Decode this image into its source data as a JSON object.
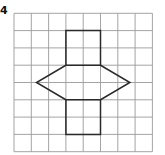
{
  "question": {
    "number": "4"
  },
  "grid": {
    "cols": 8,
    "rows": 8,
    "origin_x": 14,
    "origin_y": 13.3,
    "cell": 17.3,
    "line_color": "#9a9a9a"
  },
  "shape": {
    "stroke_color": "#2a2a2a",
    "description": "Net of a triangular/hexagonal prism: vertical rectangle 2 cols wide x 6 rows tall with two triangular wings",
    "outline_points_grid": [
      [
        3,
        1
      ],
      [
        5,
        1
      ],
      [
        5,
        3
      ],
      [
        6.7,
        4
      ],
      [
        5,
        5
      ],
      [
        5,
        7
      ],
      [
        3,
        7
      ],
      [
        3,
        5
      ],
      [
        1.3,
        4
      ],
      [
        3,
        3
      ]
    ],
    "inner_lines_grid": [
      [
        [
          3,
          3
        ],
        [
          5,
          3
        ]
      ],
      [
        [
          3,
          5
        ],
        [
          5,
          5
        ]
      ]
    ]
  }
}
